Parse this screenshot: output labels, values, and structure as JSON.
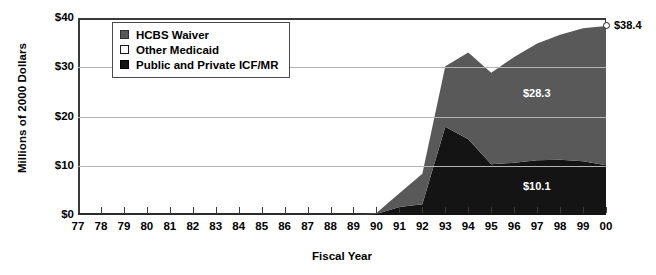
{
  "chart_data": {
    "type": "area",
    "stacked": true,
    "title": "",
    "xlabel": "Fiscal Year",
    "ylabel": "Millions of 2000 Dollars",
    "ylim": [
      0,
      40
    ],
    "ytick_labels": [
      "$0",
      "$10",
      "$20",
      "$30",
      "$40"
    ],
    "ytick_values": [
      0,
      10,
      20,
      30,
      40
    ],
    "grid": true,
    "grid_axis": "y",
    "legend_position": "upper-left-inside",
    "categories": [
      "77",
      "78",
      "79",
      "80",
      "81",
      "82",
      "83",
      "84",
      "85",
      "86",
      "87",
      "88",
      "89",
      "90",
      "91",
      "92",
      "93",
      "94",
      "95",
      "96",
      "97",
      "98",
      "99",
      "00"
    ],
    "x": [
      1977,
      1978,
      1979,
      1980,
      1981,
      1982,
      1983,
      1984,
      1985,
      1986,
      1987,
      1988,
      1989,
      1990,
      1991,
      1992,
      1993,
      1994,
      1995,
      1996,
      1997,
      1998,
      1999,
      2000
    ],
    "series": [
      {
        "name": "Public and Private ICF/MR",
        "color": "#141414",
        "values": [
          0,
          0,
          0,
          0,
          0,
          0,
          0,
          0,
          0,
          0,
          0,
          0,
          0,
          0.2,
          1.6,
          2.2,
          17.9,
          15.4,
          10.3,
          10.6,
          11.1,
          11.2,
          10.9,
          10.1
        ]
      },
      {
        "name": "Other Medicaid",
        "color": "#ffffff",
        "values": [
          0,
          0,
          0,
          0,
          0,
          0,
          0,
          0,
          0,
          0,
          0,
          0,
          0,
          0,
          0,
          0,
          0,
          0,
          0,
          0,
          0,
          0,
          0,
          0
        ]
      },
      {
        "name": "HCBS Waiver",
        "color": "#595959",
        "values": [
          0,
          0,
          0,
          0,
          0,
          0,
          0,
          0,
          0,
          0,
          0,
          0,
          0,
          0.2,
          2.8,
          6.2,
          12.3,
          17.6,
          18.6,
          21.5,
          23.7,
          25.4,
          27.0,
          28.3
        ]
      }
    ],
    "totals": [
      0,
      0,
      0,
      0,
      0,
      0,
      0,
      0,
      0,
      0,
      0,
      0,
      0,
      0.4,
      4.4,
      8.4,
      30.2,
      33.0,
      28.9,
      32.1,
      34.8,
      36.6,
      37.9,
      38.4
    ],
    "annotations": [
      {
        "name": "total-endpoint-label",
        "text": "$38.4",
        "x": 2000,
        "value": 38.4,
        "marker": "open-circle"
      },
      {
        "name": "hcbs-waiver-label",
        "text": "$28.3",
        "x": 2000,
        "value": 28.3
      },
      {
        "name": "icfmr-label",
        "text": "$10.1",
        "x": 2000,
        "value": 10.1
      }
    ]
  },
  "legend": {
    "items": [
      {
        "label": "HCBS Waiver",
        "swatch": "gray"
      },
      {
        "label": "Other Medicaid",
        "swatch": "white"
      },
      {
        "label": "Public and Private ICF/MR",
        "swatch": "black"
      }
    ]
  },
  "axes": {
    "y_title": "Millions of 2000 Dollars",
    "x_title": "Fiscal Year"
  }
}
